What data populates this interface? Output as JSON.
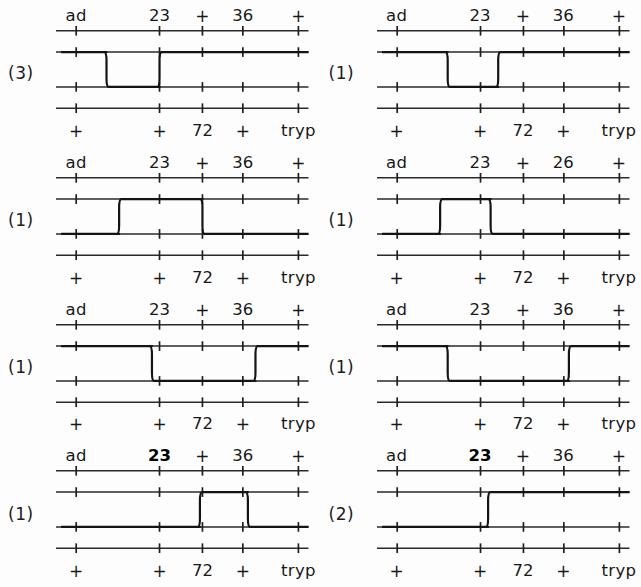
{
  "figure": {
    "background_color": "#fdfdfd",
    "ink_color": "#1a1a1a",
    "columns": 2,
    "rows": 4,
    "track_count": 4,
    "locus_count": 5
  },
  "axis": {
    "top_labels_default": [
      "ad",
      "23",
      "+",
      "36",
      "+"
    ],
    "bottom_labels_default": [
      "+",
      "+",
      "72",
      "+",
      "tryp"
    ],
    "top_label_positions_pct": [
      8,
      41,
      58,
      74,
      96
    ],
    "bottom_label_positions_pct": [
      8,
      41,
      58,
      74,
      96
    ],
    "tick_positions_pct": [
      8,
      41,
      58,
      74,
      96
    ],
    "label_72_position_pct": 58,
    "label_tryp_position_pct": 96
  },
  "panels": [
    {
      "id": "panel-1",
      "count": "(3)",
      "top_labels": [
        "ad",
        "23",
        "+",
        "36",
        "+"
      ],
      "bottom_labels": [
        "+",
        "+",
        "72",
        "+",
        "tryp"
      ],
      "bold_label_index": null,
      "trace_description": "drops from track 2 to track 3 before the 23 locus and returns up to track 2 just after the 23 locus",
      "trace_segments": [
        {
          "from_pct": 2,
          "to_pct": 20,
          "level": 2
        },
        {
          "from_pct": 20,
          "to_pct": 41,
          "level": 3
        },
        {
          "from_pct": 41,
          "to_pct": 100,
          "level": 2
        }
      ]
    },
    {
      "id": "panel-2",
      "count": "(1)",
      "top_labels": [
        "ad",
        "23",
        "+",
        "36",
        "+"
      ],
      "bottom_labels": [
        "+",
        "+",
        "72",
        "+",
        "tryp"
      ],
      "bold_label_index": null,
      "trace_description": "drops from track 2 to track 3 before the 23 locus, runs low with a small notch, then rises back to track 2 near the 72 marker",
      "trace_segments": [
        {
          "from_pct": 2,
          "to_pct": 28,
          "level": 2
        },
        {
          "from_pct": 28,
          "to_pct": 48,
          "level": 3
        },
        {
          "from_pct": 48,
          "to_pct": 100,
          "level": 2
        }
      ]
    },
    {
      "id": "panel-3",
      "count": "(1)",
      "top_labels": [
        "ad",
        "23",
        "+",
        "36",
        "+"
      ],
      "bottom_labels": [
        "+",
        "+",
        "72",
        "+",
        "tryp"
      ],
      "bold_label_index": null,
      "trace_description": "runs on track 3, rises to track 2 before the 23 locus and drops back to track 3 just past the 72 marker",
      "trace_segments": [
        {
          "from_pct": 2,
          "to_pct": 25,
          "level": 3
        },
        {
          "from_pct": 25,
          "to_pct": 58,
          "level": 2
        },
        {
          "from_pct": 58,
          "to_pct": 100,
          "level": 3
        }
      ]
    },
    {
      "id": "panel-4",
      "count": "(1)",
      "top_labels": [
        "ad",
        "23",
        "+",
        "26",
        "+"
      ],
      "bottom_labels": [
        "+",
        "+",
        "72",
        "+",
        "tryp"
      ],
      "bold_label_index": null,
      "trace_description": "runs on track 3, rises to track 2 before the 23 locus for a short interval then drops back to track 3 before the 72 marker",
      "trace_segments": [
        {
          "from_pct": 2,
          "to_pct": 25,
          "level": 3
        },
        {
          "from_pct": 25,
          "to_pct": 45,
          "level": 2
        },
        {
          "from_pct": 45,
          "to_pct": 100,
          "level": 3
        }
      ]
    },
    {
      "id": "panel-5",
      "count": "(1)",
      "top_labels": [
        "ad",
        "23",
        "+",
        "36",
        "+"
      ],
      "bottom_labels": [
        "+",
        "+",
        "72",
        "+",
        "tryp"
      ],
      "bold_label_index": null,
      "trace_description": "drops from track 2 to track 3 at the 23 locus and stays low across the middle, rising back to track 2 past the 36 locus",
      "trace_segments": [
        {
          "from_pct": 2,
          "to_pct": 38,
          "level": 2
        },
        {
          "from_pct": 38,
          "to_pct": 79,
          "level": 3
        },
        {
          "from_pct": 79,
          "to_pct": 100,
          "level": 2
        }
      ]
    },
    {
      "id": "panel-6",
      "count": "(1)",
      "top_labels": [
        "ad",
        "23",
        "+",
        "36",
        "+"
      ],
      "bottom_labels": [
        "+",
        "+",
        "72",
        "+",
        "tryp"
      ],
      "bold_label_index": null,
      "trace_description": "drops from track 2 to track 3 before the 23 locus, runs low, then rises to track 2 just after the 36 locus with a short dip back",
      "trace_segments": [
        {
          "from_pct": 2,
          "to_pct": 28,
          "level": 2
        },
        {
          "from_pct": 28,
          "to_pct": 76,
          "level": 3
        },
        {
          "from_pct": 76,
          "to_pct": 100,
          "level": 2
        }
      ]
    },
    {
      "id": "panel-7",
      "count": "(1)",
      "top_labels": [
        "ad",
        "23",
        "+",
        "36",
        "+"
      ],
      "bottom_labels": [
        "+",
        "+",
        "72",
        "+",
        "tryp"
      ],
      "bold_label_index": 1,
      "trace_description": "runs on track 3, rises to track 2 just before the 72 marker for a short interval then drops back to track 3 before the 36 locus",
      "trace_segments": [
        {
          "from_pct": 2,
          "to_pct": 57,
          "level": 3
        },
        {
          "from_pct": 57,
          "to_pct": 76,
          "level": 2
        },
        {
          "from_pct": 76,
          "to_pct": 100,
          "level": 3
        }
      ]
    },
    {
      "id": "panel-8",
      "count": "(2)",
      "top_labels": [
        "ad",
        "23",
        "+",
        "36",
        "+"
      ],
      "bottom_labels": [
        "+",
        "+",
        "72",
        "+",
        "tryp"
      ],
      "bold_label_index": 1,
      "trace_description": "runs on track 3 and rises to track 2 just past the 23 locus, remaining high to the right end",
      "trace_segments": [
        {
          "from_pct": 2,
          "to_pct": 44,
          "level": 3
        },
        {
          "from_pct": 44,
          "to_pct": 100,
          "level": 2
        }
      ]
    }
  ]
}
